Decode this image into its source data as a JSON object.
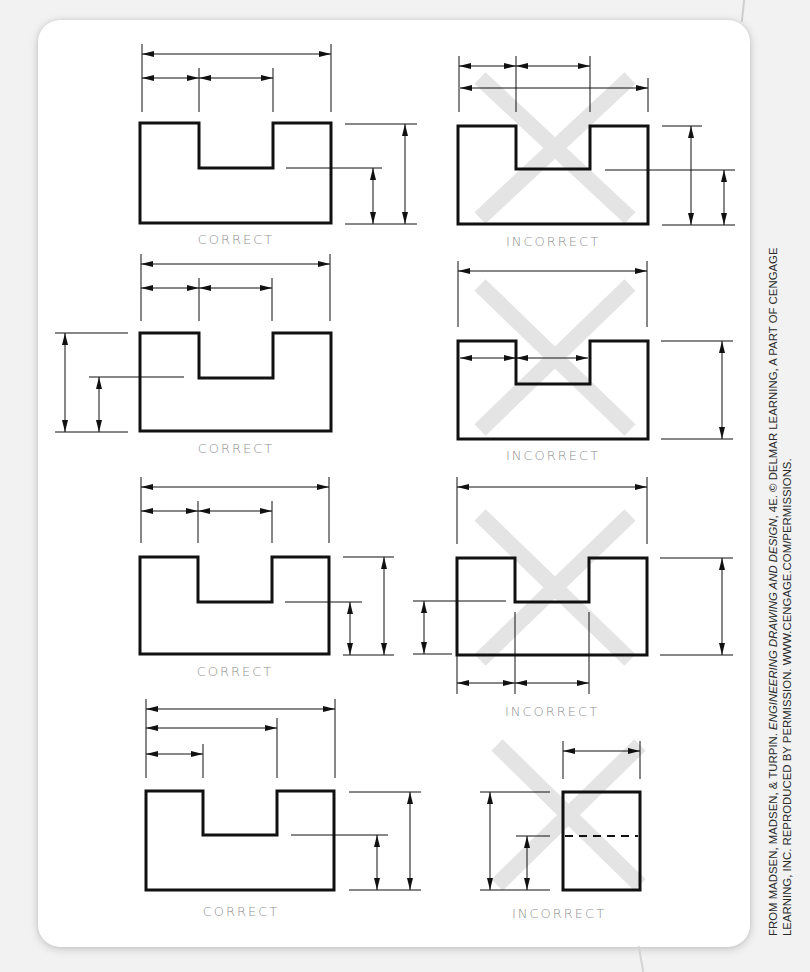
{
  "figure": {
    "panels": [
      {
        "row": 1,
        "column": "left",
        "label": "CORRECT",
        "description": "U-shaped part; chain dims above, height dims on right"
      },
      {
        "row": 1,
        "column": "right",
        "label": "INCORRECT",
        "description": "Shorter dims placed outside the overall dim"
      },
      {
        "row": 2,
        "column": "left",
        "label": "CORRECT",
        "description": "Height dims on left, chain dims above"
      },
      {
        "row": 2,
        "column": "right",
        "label": "INCORRECT",
        "description": "Dimensions placed inside the object outline"
      },
      {
        "row": 3,
        "column": "left",
        "label": "CORRECT",
        "description": "Chain dims above, stacked height dims on right"
      },
      {
        "row": 3,
        "column": "right",
        "label": "INCORRECT",
        "description": "Dims scattered on multiple sides"
      },
      {
        "row": 4,
        "column": "left",
        "label": "CORRECT",
        "description": "Baseline dims above, height dims on right"
      },
      {
        "row": 4,
        "column": "right",
        "label": "INCORRECT",
        "description": "Dimension to hidden line"
      }
    ],
    "labels": {
      "correct": "CORRECT",
      "incorrect": "INCORRECT"
    },
    "colors": {
      "line": "#111111",
      "label": "#8f8f8f",
      "cross_mark": "#e6e6e6",
      "card_bg": "#ffffff",
      "page_bg": "#f2f2f2"
    }
  },
  "credit": {
    "line1_prefix": "FROM MADSEN, MADSEN, & TURPIN. ",
    "line1_title": "ENGINEERING DRAWING AND DESIGN",
    "line1_suffix": ", 4E. © DELMAR LEARNING, A PART OF CENGAGE",
    "line2": "LEARNING, INC. REPRODUCED BY PERMISSION. WWW.CENGAGE.COM/PERMISSIONS."
  }
}
